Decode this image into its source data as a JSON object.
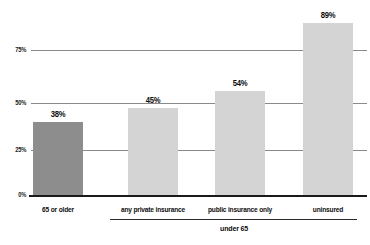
{
  "chart_data": {
    "type": "bar",
    "title": "",
    "xlabel": "",
    "ylabel": "",
    "categories": [
      "65 or older",
      "any private insurance",
      "public insurance only",
      "uninsured"
    ],
    "values": [
      38,
      45,
      54,
      89
    ],
    "value_labels": [
      "38%",
      "45%",
      "54%",
      "89%"
    ],
    "series": [
      {
        "name": "percent",
        "values": [
          38,
          45,
          54,
          89
        ]
      }
    ],
    "ylim": [
      0,
      100
    ],
    "yticks": [
      0,
      25,
      50,
      75
    ],
    "ytick_labels": [
      "0%",
      "25%",
      "50%",
      "75%"
    ],
    "grid": true,
    "legend": "none",
    "bar_colors": [
      "#8d8d8d",
      "#d4d4d4",
      "#d4d4d4",
      "#d4d4d4"
    ],
    "gridline_color": "#8a8a8a",
    "baseline_color": "#1a1a1a",
    "background": "#ffffff",
    "groups": [
      {
        "label": "under 65",
        "member_categories": [
          "any private insurance",
          "public insurance only",
          "uninsured"
        ]
      }
    ]
  }
}
